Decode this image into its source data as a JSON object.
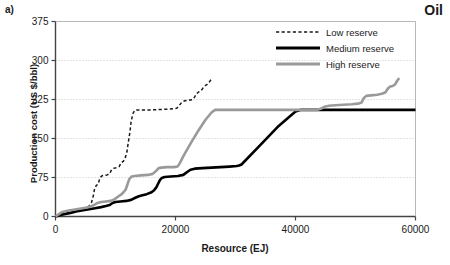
{
  "panel": {
    "label": "a)"
  },
  "corner": {
    "title": "Oil"
  },
  "chart_data": {
    "type": "line",
    "title": "Oil",
    "panel_label": "a)",
    "xlabel": "Resource (EJ)",
    "ylabel": "Production cost (US $/bbl)",
    "xlim": [
      0,
      60000
    ],
    "ylim": [
      0,
      375
    ],
    "xticks": [
      0,
      20000,
      40000,
      60000
    ],
    "xticklabels": [
      "0",
      "20000",
      "40000",
      "60000"
    ],
    "yticks": [
      0,
      75,
      150,
      225,
      300,
      375
    ],
    "yticklabels": [
      "0",
      "75",
      "150",
      "225",
      "300",
      "375"
    ],
    "grid": "horizontal-dotted",
    "legend_position": "top-right",
    "legend": [
      "Low reserve",
      "Medium reserve",
      "High reserve"
    ],
    "colors": {
      "low_reserve": "#1a1a1a",
      "medium_reserve": "#000000",
      "high_reserve": "#9a9a9a",
      "grid": "#c8c8c8",
      "axis": "#555555"
    },
    "series": [
      {
        "name": "Low reserve",
        "style": "dashed",
        "color": "#1a1a1a",
        "points": [
          [
            0,
            0
          ],
          [
            900,
            6
          ],
          [
            1800,
            9
          ],
          [
            2600,
            11
          ],
          [
            3400,
            13
          ],
          [
            4200,
            15
          ],
          [
            5000,
            17
          ],
          [
            5600,
            20
          ],
          [
            6000,
            27
          ],
          [
            6300,
            40
          ],
          [
            6500,
            52
          ],
          [
            6800,
            60
          ],
          [
            7100,
            62
          ],
          [
            7400,
            74
          ],
          [
            7700,
            78
          ],
          [
            8000,
            79
          ],
          [
            8600,
            80
          ],
          [
            9000,
            82
          ],
          [
            9400,
            91
          ],
          [
            9800,
            93
          ],
          [
            10200,
            94
          ],
          [
            10600,
            96
          ],
          [
            11000,
            104
          ],
          [
            11300,
            106
          ],
          [
            11600,
            112
          ],
          [
            11900,
            124
          ],
          [
            12100,
            140
          ],
          [
            12400,
            162
          ],
          [
            12600,
            182
          ],
          [
            12900,
            198
          ],
          [
            13200,
            204
          ],
          [
            13600,
            205
          ],
          [
            14500,
            205
          ],
          [
            16000,
            205
          ],
          [
            18000,
            206
          ],
          [
            19600,
            207
          ],
          [
            20200,
            208
          ],
          [
            20600,
            213
          ],
          [
            21000,
            219
          ],
          [
            21400,
            222
          ],
          [
            21900,
            223
          ],
          [
            22400,
            224
          ],
          [
            22900,
            225
          ],
          [
            23200,
            230
          ],
          [
            23500,
            236
          ],
          [
            23800,
            239
          ],
          [
            24100,
            241
          ],
          [
            24400,
            244
          ],
          [
            24700,
            249
          ],
          [
            25000,
            252
          ],
          [
            25300,
            254
          ],
          [
            25600,
            258
          ],
          [
            25900,
            263
          ],
          [
            26100,
            266
          ]
        ]
      },
      {
        "name": "Medium reserve",
        "style": "solid-thick",
        "color": "#000000",
        "points": [
          [
            0,
            0
          ],
          [
            1200,
            4
          ],
          [
            2500,
            7
          ],
          [
            3600,
            10
          ],
          [
            4600,
            12
          ],
          [
            5600,
            14
          ],
          [
            6600,
            16
          ],
          [
            7600,
            18
          ],
          [
            8400,
            20
          ],
          [
            9000,
            22
          ],
          [
            9500,
            26
          ],
          [
            10000,
            28
          ],
          [
            10800,
            29
          ],
          [
            11800,
            30
          ],
          [
            12600,
            32
          ],
          [
            13300,
            36
          ],
          [
            13900,
            39
          ],
          [
            14500,
            41
          ],
          [
            15200,
            43
          ],
          [
            15900,
            46
          ],
          [
            16400,
            50
          ],
          [
            16800,
            56
          ],
          [
            17100,
            63
          ],
          [
            17400,
            70
          ],
          [
            17700,
            74
          ],
          [
            18200,
            76
          ],
          [
            19200,
            77
          ],
          [
            20400,
            78
          ],
          [
            21300,
            80
          ],
          [
            22000,
            86
          ],
          [
            22500,
            90
          ],
          [
            23200,
            92
          ],
          [
            24500,
            93
          ],
          [
            26000,
            94
          ],
          [
            27500,
            95
          ],
          [
            29000,
            96
          ],
          [
            30200,
            97
          ],
          [
            30600,
            98
          ],
          [
            31000,
            100
          ],
          [
            34000,
            136
          ],
          [
            37000,
            172
          ],
          [
            40000,
            202
          ],
          [
            40800,
            205
          ],
          [
            42500,
            205
          ],
          [
            46000,
            205
          ],
          [
            50000,
            205
          ],
          [
            54000,
            205
          ],
          [
            58000,
            205
          ],
          [
            60000,
            205
          ]
        ]
      },
      {
        "name": "High reserve",
        "style": "solid",
        "color": "#9a9a9a",
        "points": [
          [
            0,
            0
          ],
          [
            1000,
            8
          ],
          [
            2000,
            11
          ],
          [
            3000,
            13
          ],
          [
            4000,
            15
          ],
          [
            5000,
            17
          ],
          [
            5800,
            19
          ],
          [
            6400,
            22
          ],
          [
            7000,
            26
          ],
          [
            7600,
            28
          ],
          [
            8400,
            29
          ],
          [
            9200,
            30
          ],
          [
            9800,
            33
          ],
          [
            10400,
            38
          ],
          [
            10900,
            42
          ],
          [
            11300,
            46
          ],
          [
            11700,
            52
          ],
          [
            12000,
            62
          ],
          [
            12300,
            72
          ],
          [
            12700,
            77
          ],
          [
            13200,
            78
          ],
          [
            14200,
            79
          ],
          [
            15400,
            80
          ],
          [
            16200,
            82
          ],
          [
            16800,
            88
          ],
          [
            17200,
            93
          ],
          [
            17600,
            94
          ],
          [
            18600,
            95
          ],
          [
            19800,
            95
          ],
          [
            20300,
            96
          ],
          [
            20600,
            100
          ],
          [
            21400,
            118
          ],
          [
            22600,
            142
          ],
          [
            23800,
            165
          ],
          [
            25000,
            186
          ],
          [
            26000,
            200
          ],
          [
            26600,
            205
          ],
          [
            28000,
            205
          ],
          [
            32000,
            205
          ],
          [
            36000,
            205
          ],
          [
            40000,
            205
          ],
          [
            43500,
            205
          ],
          [
            44200,
            207
          ],
          [
            44800,
            211
          ],
          [
            45600,
            213
          ],
          [
            46600,
            214
          ],
          [
            48000,
            215
          ],
          [
            49400,
            216
          ],
          [
            50400,
            217
          ],
          [
            51000,
            219
          ],
          [
            51400,
            228
          ],
          [
            51800,
            232
          ],
          [
            52600,
            233
          ],
          [
            53600,
            234
          ],
          [
            54400,
            236
          ],
          [
            55000,
            239
          ],
          [
            55400,
            246
          ],
          [
            55800,
            250
          ],
          [
            56200,
            251
          ],
          [
            56600,
            254
          ],
          [
            57000,
            262
          ],
          [
            57300,
            266
          ]
        ]
      }
    ]
  }
}
